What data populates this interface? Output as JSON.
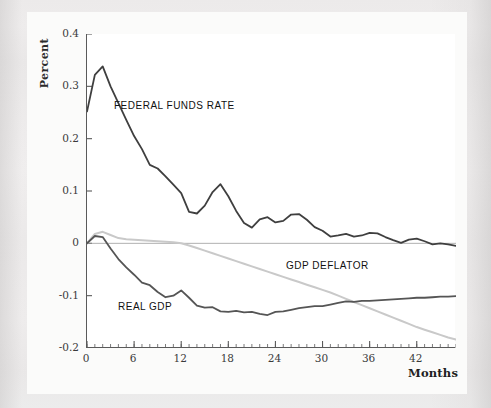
{
  "figure": {
    "axis_label_y": "Percent",
    "axis_label_x": "Months",
    "y_ticks": [
      "0.4",
      "0.3",
      "0.2",
      "0.1",
      "0",
      "-0.1",
      "-0.2"
    ],
    "x_ticks": [
      "0",
      "6",
      "12",
      "18",
      "24",
      "30",
      "36",
      "42"
    ],
    "series_labels": {
      "federal_funds_rate": "FEDERAL FUNDS RATE",
      "gdp_deflator": "GDP DEFLATOR",
      "real_gdp": "REAL GDP"
    },
    "colors": {
      "federal_funds_rate": "#3f3f3f",
      "real_gdp": "#555555",
      "gdp_deflator": "#c9c9c9",
      "axis": "#5a5a5a",
      "zero_line": "#9a9a9a",
      "plot_background": "#ffffff",
      "page_background": "#ecebeb"
    }
  },
  "chart_data": {
    "type": "line",
    "title": "",
    "subtitle": "",
    "xlabel": "Months",
    "ylabel": "Percent",
    "xlim": [
      0,
      47
    ],
    "ylim": [
      -0.2,
      0.4
    ],
    "x_ticks": [
      0,
      6,
      12,
      18,
      24,
      30,
      36,
      42
    ],
    "y_ticks": [
      -0.2,
      -0.1,
      0,
      0.1,
      0.2,
      0.3,
      0.4
    ],
    "minor_x_tick_interval": 1,
    "grid": false,
    "legend": "inline-annotations",
    "zero_line": true,
    "x": [
      0,
      1,
      2,
      3,
      4,
      5,
      6,
      7,
      8,
      9,
      10,
      11,
      12,
      13,
      14,
      15,
      16,
      17,
      18,
      19,
      20,
      21,
      22,
      23,
      24,
      25,
      26,
      27,
      28,
      29,
      30,
      31,
      32,
      33,
      34,
      35,
      36,
      37,
      38,
      39,
      40,
      41,
      42,
      43,
      44,
      45,
      46,
      47
    ],
    "series": [
      {
        "name": "FEDERAL FUNDS RATE",
        "color": "#3f3f3f",
        "values": [
          0.252,
          0.322,
          0.338,
          0.3,
          0.268,
          0.236,
          0.205,
          0.18,
          0.15,
          0.143,
          0.128,
          0.112,
          0.096,
          0.06,
          0.057,
          0.072,
          0.098,
          0.113,
          0.09,
          0.062,
          0.039,
          0.03,
          0.046,
          0.05,
          0.04,
          0.043,
          0.055,
          0.056,
          0.045,
          0.031,
          0.024,
          0.013,
          0.015,
          0.018,
          0.013,
          0.015,
          0.02,
          0.019,
          0.012,
          0.006,
          0.001,
          0.007,
          0.009,
          0.004,
          -0.002,
          0.0,
          -0.002,
          -0.005
        ]
      },
      {
        "name": "REAL GDP",
        "color": "#555555",
        "values": [
          0.0,
          0.014,
          0.012,
          -0.01,
          -0.03,
          -0.046,
          -0.06,
          -0.075,
          -0.08,
          -0.093,
          -0.103,
          -0.1,
          -0.09,
          -0.104,
          -0.119,
          -0.123,
          -0.122,
          -0.13,
          -0.131,
          -0.129,
          -0.132,
          -0.131,
          -0.135,
          -0.137,
          -0.131,
          -0.13,
          -0.127,
          -0.124,
          -0.122,
          -0.12,
          -0.12,
          -0.117,
          -0.114,
          -0.111,
          -0.112,
          -0.11,
          -0.11,
          -0.109,
          -0.108,
          -0.107,
          -0.106,
          -0.105,
          -0.104,
          -0.104,
          -0.103,
          -0.102,
          -0.102,
          -0.101
        ]
      },
      {
        "name": "GDP DEFLATOR",
        "color": "#c9c9c9",
        "values": [
          0.0,
          0.018,
          0.022,
          0.016,
          0.01,
          0.008,
          0.007,
          0.006,
          0.005,
          0.004,
          0.003,
          0.002,
          0.0,
          -0.004,
          -0.009,
          -0.014,
          -0.019,
          -0.024,
          -0.029,
          -0.034,
          -0.039,
          -0.044,
          -0.049,
          -0.054,
          -0.059,
          -0.064,
          -0.069,
          -0.074,
          -0.079,
          -0.084,
          -0.089,
          -0.094,
          -0.1,
          -0.106,
          -0.112,
          -0.118,
          -0.124,
          -0.13,
          -0.136,
          -0.142,
          -0.148,
          -0.154,
          -0.16,
          -0.165,
          -0.17,
          -0.175,
          -0.18,
          -0.184
        ]
      }
    ]
  }
}
